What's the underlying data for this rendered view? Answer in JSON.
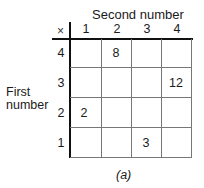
{
  "diagram": {
    "column_axis_title": "Second number",
    "row_axis_title_line1": "First",
    "row_axis_title_line2": "number",
    "operator_symbol": "×",
    "column_headers": [
      "1",
      "2",
      "3",
      "4"
    ],
    "row_headers": [
      "4",
      "3",
      "2",
      "1"
    ],
    "cells": [
      [
        "",
        "8",
        "",
        ""
      ],
      [
        "",
        "",
        "",
        "12"
      ],
      [
        "2",
        "",
        "",
        ""
      ],
      [
        "",
        "",
        "3",
        ""
      ]
    ],
    "caption": "(a)"
  }
}
